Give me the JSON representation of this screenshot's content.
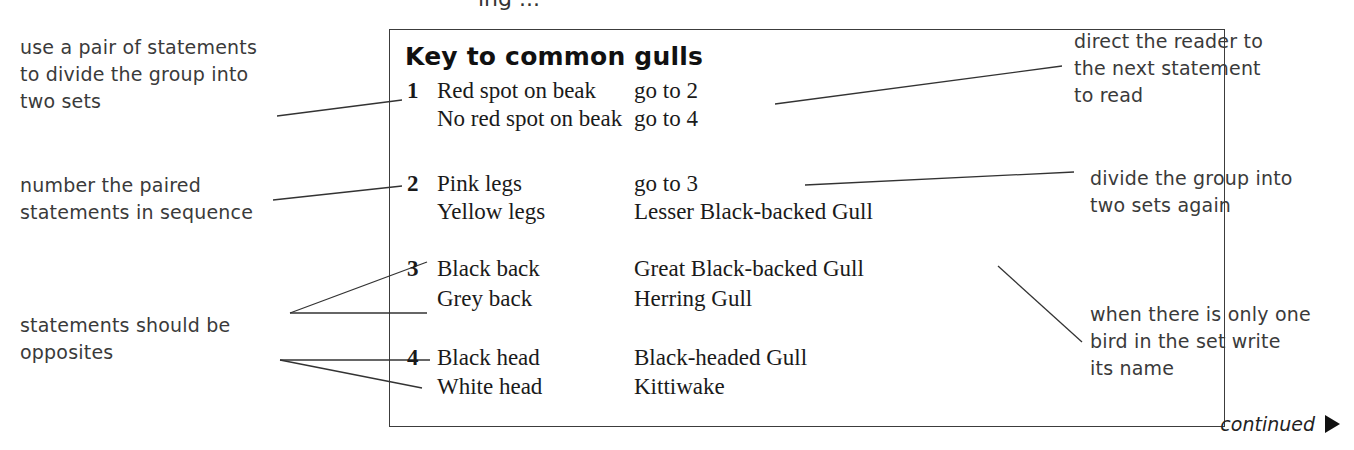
{
  "top_fragment": "ing ...",
  "key": {
    "title": "Key to common gulls",
    "pairs": [
      {
        "number": "1",
        "statements": [
          {
            "text": "Red spot on beak",
            "result": "go to 2"
          },
          {
            "text": "No red spot on beak",
            "result": "go to 4"
          }
        ]
      },
      {
        "number": "2",
        "statements": [
          {
            "text": "Pink legs",
            "result": "go to 3"
          },
          {
            "text": "Yellow legs",
            "result": "Lesser Black-backed Gull"
          }
        ]
      },
      {
        "number": "3",
        "statements": [
          {
            "text": "Black back",
            "result": "Great Black-backed Gull"
          },
          {
            "text": "Grey back",
            "result": "Herring Gull"
          }
        ]
      },
      {
        "number": "4",
        "statements": [
          {
            "text": "Black head",
            "result": "Black-headed Gull"
          },
          {
            "text": "White head",
            "result": "Kittiwake"
          }
        ]
      }
    ]
  },
  "annotations": {
    "left": [
      {
        "lines": [
          "use a pair of statements",
          "to divide the group into",
          "two sets"
        ]
      },
      {
        "lines": [
          "number the paired",
          "statements in sequence"
        ]
      },
      {
        "lines": [
          "statements should be",
          "opposites"
        ]
      }
    ],
    "right": [
      {
        "lines": [
          "direct the reader to",
          "the next statement",
          "to read"
        ]
      },
      {
        "lines": [
          "divide the group into",
          "two sets again"
        ]
      },
      {
        "lines": [
          "when there is only one",
          "bird in the set write",
          "its name"
        ]
      }
    ]
  },
  "footer": {
    "continued_label": "continued",
    "arrow_icon": "right-triangle"
  }
}
